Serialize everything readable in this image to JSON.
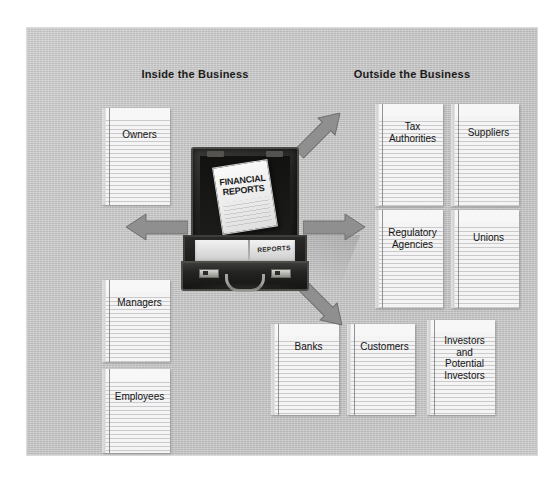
{
  "figure": {
    "headings": {
      "inside": "Inside the Business",
      "outside": "Outside the Business"
    },
    "briefcase": {
      "document_title": "FINANCIAL\nREPORTS",
      "stack_label": "REPORTS"
    },
    "inside_cards": [
      {
        "id": "owners",
        "label": "Owners"
      },
      {
        "id": "managers",
        "label": "Managers"
      },
      {
        "id": "employees",
        "label": "Employees"
      }
    ],
    "outside_cards": [
      {
        "id": "tax",
        "label": "Tax\nAuthorities"
      },
      {
        "id": "suppliers",
        "label": "Suppliers"
      },
      {
        "id": "regulatory",
        "label": "Regulatory\nAgencies"
      },
      {
        "id": "unions",
        "label": "Unions"
      },
      {
        "id": "banks",
        "label": "Banks"
      },
      {
        "id": "customers",
        "label": "Customers"
      },
      {
        "id": "investors",
        "label": "Investors\nand\nPotential\nInvestors"
      }
    ],
    "arrows": [
      {
        "id": "left",
        "direction": "left"
      },
      {
        "id": "right",
        "direction": "right"
      },
      {
        "id": "upright",
        "direction": "up-right"
      },
      {
        "id": "downright",
        "direction": "down-right"
      }
    ],
    "colors": {
      "panel_background": "#c4c4c4",
      "card_background": "#f4f4f4",
      "card_rule": "#9698a0",
      "arrow_fill": "#8f8f8f",
      "arrow_stroke": "#6e6e6e",
      "briefcase_body": "#1d1d1c",
      "text": "#141414"
    }
  }
}
